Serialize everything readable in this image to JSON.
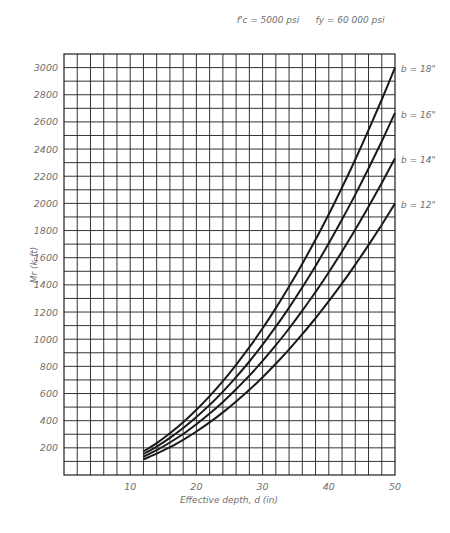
{
  "chart_data": {
    "type": "line",
    "title": "",
    "annotations": {
      "fc": "f'c = 5000 psi",
      "fy": "fy = 60 000 psi"
    },
    "xlabel": "Effective depth, d (in)",
    "ylabel": "Mr (k-ft)",
    "xlim": [
      0,
      50
    ],
    "ylim": [
      0,
      3100
    ],
    "x_ticks": [
      10,
      20,
      30,
      40,
      50
    ],
    "y_ticks": [
      200,
      400,
      600,
      800,
      1000,
      1200,
      1400,
      1600,
      1800,
      2000,
      2200,
      2400,
      2600,
      2800,
      3000
    ],
    "grid": {
      "on": true,
      "x_step": 2,
      "y_step": 100
    },
    "legend_position": "right-end-labels",
    "x": [
      12,
      14,
      16,
      18,
      20,
      22,
      24,
      26,
      28,
      30,
      32,
      34,
      36,
      38,
      40,
      42,
      44,
      46,
      48,
      50
    ],
    "series": [
      {
        "name": "b = 18\"",
        "b": 18,
        "values": [
          173,
          235,
          307,
          389,
          480,
          581,
          691,
          811,
          941,
          1080,
          1229,
          1387,
          1555,
          1733,
          1920,
          2117,
          2323,
          2539,
          2765,
          3000
        ]
      },
      {
        "name": "b = 16\"",
        "b": 16,
        "values": [
          154,
          209,
          273,
          346,
          427,
          516,
          614,
          721,
          836,
          960,
          1092,
          1233,
          1382,
          1540,
          1707,
          1882,
          2065,
          2257,
          2458,
          2667
        ]
      },
      {
        "name": "b = 14\"",
        "b": 14,
        "values": [
          134,
          183,
          239,
          302,
          373,
          452,
          538,
          631,
          732,
          840,
          956,
          1079,
          1210,
          1348,
          1493,
          1646,
          1807,
          1975,
          2150,
          2333
        ]
      },
      {
        "name": "b = 12\"",
        "b": 12,
        "values": [
          115,
          157,
          205,
          259,
          320,
          387,
          461,
          541,
          627,
          720,
          819,
          925,
          1037,
          1155,
          1280,
          1411,
          1549,
          1693,
          1843,
          2000
        ]
      }
    ]
  },
  "layout": {
    "plot": {
      "left": 64,
      "right": 395,
      "top": 54,
      "bottom": 475
    }
  }
}
